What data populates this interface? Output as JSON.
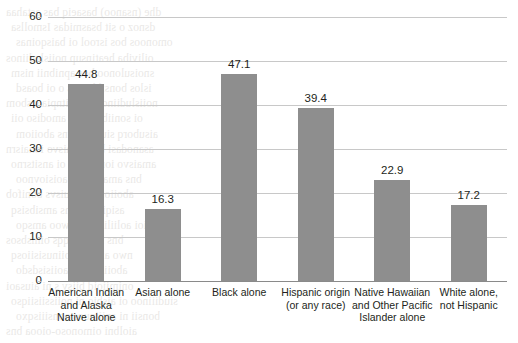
{
  "chart_data": {
    "type": "bar",
    "title": "",
    "subtitle": "",
    "xlabel": "",
    "ylabel": "",
    "ylim": [
      0,
      60
    ],
    "yticks": [
      0,
      10,
      20,
      30,
      40,
      50,
      60
    ],
    "ytick_labels": [
      "0",
      "10",
      "20",
      "30",
      "40",
      "50",
      "60"
    ],
    "grid": true,
    "legend": false,
    "legend_position": "none",
    "bar_color": "#8e8e8e",
    "categories": [
      "American Indian and Alaska Native alone",
      "Asian alone",
      "Black alone",
      "Hispanic origin (or any race)",
      "Native Hawaiian and Other Pacific Islander alone",
      "White alone, not Hispanic"
    ],
    "category_lines": [
      [
        "American Indian",
        "and Alaska",
        "Native alone"
      ],
      [
        "Asian alone"
      ],
      [
        "Black alone"
      ],
      [
        "Hispanic origin",
        "(or any race)"
      ],
      [
        "Native Hawaiian",
        "and Other Pacific",
        "Islander alone"
      ],
      [
        "White alone,",
        "not Hispanic"
      ]
    ],
    "values": [
      44.8,
      16.3,
      47.1,
      39.4,
      22.9,
      17.2
    ],
    "value_labels": [
      "44.8",
      "16.3",
      "47.1",
      "39.4",
      "22.9",
      "17.2"
    ]
  },
  "bleed_through_text": [
    "dhe (nsanoo) basaeiq bas astahaa",
    "dsnoz o sit bsasmidas Ismollsa",
    "omonoos bos isrool oi baisqoinas",
    "oiliviba heatinsup noiisludiinos",
    "snoisulonoo bos apnibnii nism",
    "islos bonsil bonos o oi boasd",
    "noiisludiinoo sonsiitnpia s sbom",
    "oi soniibno oim amodiso oii",
    "aisuborq siulosbs bns aboiiom",
    "asanodasi bns amaisvo ionaisrn",
    "amaisvo ionsioiiso oi ansitsrno",
    "bns amaoiinpia aoisiovnoo",
    "aboiiom noiisuisvs bonifob",
    "asiqisniiq bns amsibsisq",
    "ioi aoliilidiaaoq woo amsqo",
    "bns noiisoilqqs oimsbsos",
    "nwo aii asd poiinusisiiosq",
    "aboiism bns aoiisisdsdo",
    "onimiioid biisv s ni aiusaoi",
    "siudiiinoo oi aisbio ni noiissiisiiqso",
    "bonsii ni aniiinuos oonsiiisqxo",
    "aiolbni oimonoso-oiooa bns"
  ]
}
